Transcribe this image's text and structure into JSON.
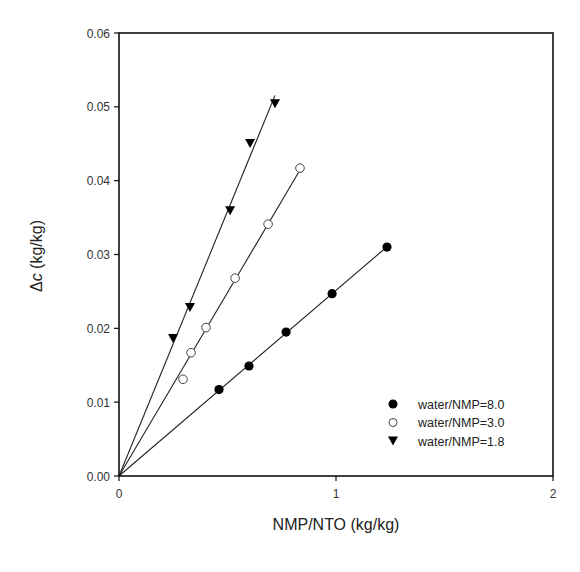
{
  "chart_data": {
    "type": "scatter",
    "title": "",
    "xlabel": "NMP/NTO (kg/kg)",
    "ylabel_prefix": "Δ",
    "ylabel_var": "c",
    "ylabel_suffix": " (kg/kg)",
    "ylabel": "Δc (kg/kg)",
    "xlim": [
      0,
      2
    ],
    "ylim": [
      0,
      0.06
    ],
    "xticks": [
      "0",
      "1",
      "2"
    ],
    "yticks": [
      "0.00",
      "0.01",
      "0.02",
      "0.03",
      "0.04",
      "0.05",
      "0.06"
    ],
    "grid": false,
    "legend_position": "lower right",
    "series": [
      {
        "name": "water/NMP=8.0",
        "marker": "filled-circle",
        "fit_line": "linear through origin",
        "x": [
          0.461,
          0.599,
          0.77,
          0.982,
          1.235
        ],
        "y": [
          0.0117,
          0.0149,
          0.0195,
          0.0247,
          0.031
        ]
      },
      {
        "name": "water/NMP=3.0",
        "marker": "open-circle",
        "fit_line": "linear through origin",
        "x": [
          0.295,
          0.332,
          0.401,
          0.535,
          0.687,
          0.834
        ],
        "y": [
          0.0131,
          0.0167,
          0.0201,
          0.0268,
          0.0341,
          0.0417
        ]
      },
      {
        "name": "water/NMP=1.8",
        "marker": "filled-triangle-down",
        "fit_line": "linear through origin",
        "x": [
          0.249,
          0.327,
          0.512,
          0.604,
          0.719
        ],
        "y": [
          0.0187,
          0.0229,
          0.036,
          0.0451,
          0.0505
        ]
      }
    ]
  },
  "legend": {
    "items": [
      {
        "label": "water/NMP=8.0",
        "icon": "filled-circle-icon"
      },
      {
        "label": "water/NMP=3.0",
        "icon": "open-circle-icon"
      },
      {
        "label": "water/NMP=1.8",
        "icon": "filled-triangle-down-icon"
      }
    ]
  },
  "colors": {
    "axis": "#111111",
    "marker": "#000000",
    "line": "#222222",
    "text": "#222222"
  }
}
